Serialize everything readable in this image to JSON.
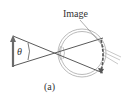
{
  "figure": {
    "caption": "(a)",
    "image_label": "Image",
    "angle_label": "θ"
  },
  "colors": {
    "background": "#ffffff",
    "ray": "#5a5a5a",
    "object_arrow": "#6a6a6a",
    "eye_outline": "#9a9a9a",
    "retina_image": "#555555",
    "text": "#333333"
  }
}
